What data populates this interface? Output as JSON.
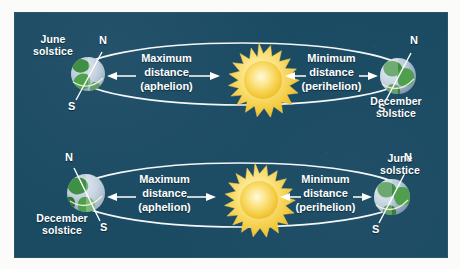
{
  "figure": {
    "background_color": "#1b4a63",
    "orbit_color": "#ffffff",
    "sun_color": "#f5d24a",
    "earth_ocean_color": "#b9c9d8",
    "earth_land_color": "#3f8f45"
  },
  "scenes": [
    {
      "id": "top",
      "left_earth": {
        "solstice_label": "June\nsolstice",
        "solstice_line1": "June",
        "solstice_line2": "solstice",
        "north_pole": "N",
        "south_pole": "S"
      },
      "right_earth": {
        "solstice_label": "December\nsolstice",
        "solstice_line1": "December",
        "solstice_line2": "solstice",
        "north_pole": "N",
        "south_pole": "S"
      },
      "left_measure": {
        "line1": "Maximum",
        "line2": "distance",
        "line3": "(aphelion)"
      },
      "right_measure": {
        "line1": "Minimum",
        "line2": "distance",
        "line3": "(perihelion)"
      }
    },
    {
      "id": "bottom",
      "left_earth": {
        "solstice_label": "December\nsolstice",
        "solstice_line1": "December",
        "solstice_line2": "solstice",
        "north_pole": "N",
        "south_pole": "S"
      },
      "right_earth": {
        "solstice_label": "June\nsolstice",
        "solstice_line1": "June",
        "solstice_line2": "solstice",
        "north_pole": "N",
        "south_pole": "S"
      },
      "left_measure": {
        "line1": "Maximum",
        "line2": "distance",
        "line3": "(aphelion)"
      },
      "right_measure": {
        "line1": "Minimum",
        "line2": "distance",
        "line3": "(perihelion)"
      }
    }
  ]
}
